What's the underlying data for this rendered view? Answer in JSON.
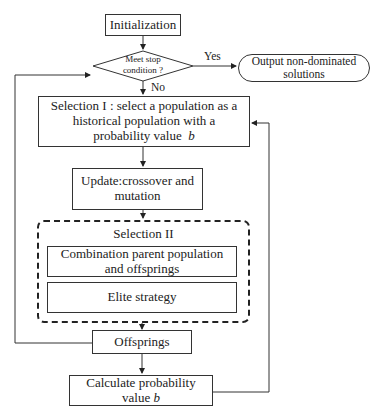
{
  "diagram": {
    "nodes": {
      "init": {
        "label": "Initialization"
      },
      "decision": {
        "line1": "Meet stop",
        "line2": "condition ?"
      },
      "output": {
        "line1": "Output non-dominated",
        "line2": "solutions"
      },
      "selection1": {
        "line1": "Selection I : select a population as a",
        "line2": "historical population with a",
        "line3": "probability value",
        "var": "b"
      },
      "update": {
        "line1": "Update:crossover and",
        "line2": "mutation"
      },
      "selection2": {
        "title": "Selection II",
        "combination": {
          "line1": "Combination parent population",
          "line2": "and offsprings"
        },
        "elite": {
          "label": "Elite strategy"
        }
      },
      "offsprings": {
        "label": "Offsprings"
      },
      "calculate": {
        "line1": "Calculate probability",
        "line2": "value",
        "var": "b"
      }
    },
    "edge_labels": {
      "yes": "Yes",
      "no": "No"
    },
    "colors": {
      "line": "#333333",
      "background": "#ffffff"
    }
  }
}
